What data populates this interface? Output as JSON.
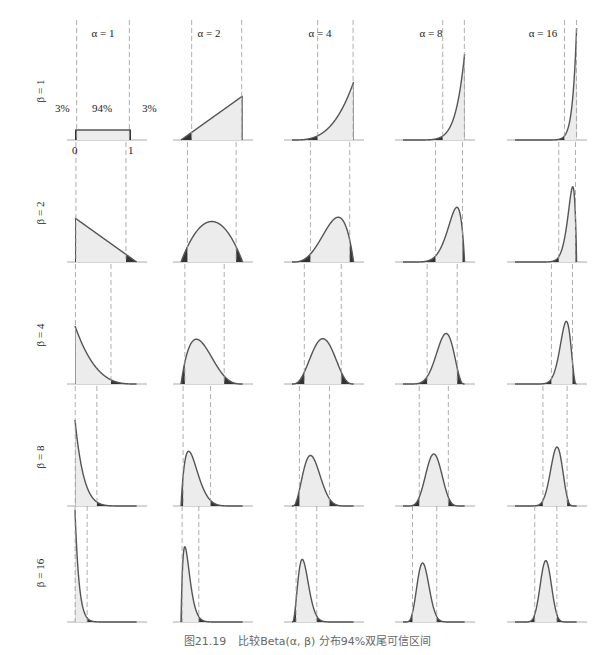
{
  "caption": {
    "number": "图21.19",
    "text": "比较Beta(α, β) 分布94%双尾可信区间"
  },
  "columns": [
    {
      "label": "α = 1",
      "alpha": 1
    },
    {
      "label": "α = 2",
      "alpha": 2
    },
    {
      "label": "α = 4",
      "alpha": 4
    },
    {
      "label": "α = 8",
      "alpha": 8
    },
    {
      "label": "α = 16",
      "alpha": 16
    }
  ],
  "rows": [
    {
      "label": "β = 1",
      "beta": 1
    },
    {
      "label": "β = 2",
      "beta": 2
    },
    {
      "label": "β = 4",
      "beta": 4
    },
    {
      "label": "β = 8",
      "beta": 8
    },
    {
      "label": "β = 16",
      "beta": 16
    }
  ],
  "annotations": {
    "left_tail": "3%",
    "center": "94%",
    "right_tail": "3%",
    "x_min": "0",
    "x_max": "1"
  },
  "colors": {
    "curve": "#555555",
    "fill": "#ececec",
    "tail": "#333333",
    "dashed": "#999999",
    "axis": "#aaaaaa"
  },
  "chart_data": {
    "type": "area",
    "title": "比较Beta(α, β) 分布94%双尾可信区间",
    "xlabel": "",
    "ylabel": "",
    "layout": "5x5 small multiples, columns α ∈ {1,2,4,8,16}, rows β ∈ {1,2,4,8,16}",
    "x_range": [
      0,
      1
    ],
    "credible_interval": 0.94,
    "tail_probability_each": 0.03,
    "series": [
      {
        "alpha": 1,
        "beta": 1,
        "interval": [
          0.03,
          0.97
        ]
      },
      {
        "alpha": 2,
        "beta": 1,
        "interval": [
          0.173,
          0.985
        ]
      },
      {
        "alpha": 4,
        "beta": 1,
        "interval": [
          0.416,
          0.992
        ]
      },
      {
        "alpha": 8,
        "beta": 1,
        "interval": [
          0.645,
          0.996
        ]
      },
      {
        "alpha": 16,
        "beta": 1,
        "interval": [
          0.803,
          0.998
        ]
      },
      {
        "alpha": 1,
        "beta": 2,
        "interval": [
          0.015,
          0.827
        ]
      },
      {
        "alpha": 2,
        "beta": 2,
        "interval": [
          0.105,
          0.895
        ]
      },
      {
        "alpha": 4,
        "beta": 2,
        "interval": [
          0.299,
          0.937
        ]
      },
      {
        "alpha": 8,
        "beta": 2,
        "interval": [
          0.528,
          0.966
        ]
      },
      {
        "alpha": 16,
        "beta": 2,
        "interval": [
          0.71,
          0.982
        ]
      },
      {
        "alpha": 1,
        "beta": 4,
        "interval": [
          0.008,
          0.584
        ]
      },
      {
        "alpha": 2,
        "beta": 4,
        "interval": [
          0.063,
          0.701
        ]
      },
      {
        "alpha": 4,
        "beta": 4,
        "interval": [
          0.2,
          0.8
        ]
      },
      {
        "alpha": 8,
        "beta": 4,
        "interval": [
          0.392,
          0.88
        ]
      },
      {
        "alpha": 16,
        "beta": 4,
        "interval": [
          0.591,
          0.933
        ]
      },
      {
        "alpha": 1,
        "beta": 8,
        "interval": [
          0.004,
          0.355
        ]
      },
      {
        "alpha": 2,
        "beta": 8,
        "interval": [
          0.034,
          0.48
        ]
      },
      {
        "alpha": 4,
        "beta": 8,
        "interval": [
          0.12,
          0.608
        ]
      },
      {
        "alpha": 8,
        "beta": 8,
        "interval": [
          0.264,
          0.736
        ]
      },
      {
        "alpha": 16,
        "beta": 8,
        "interval": [
          0.453,
          0.846
        ]
      },
      {
        "alpha": 1,
        "beta": 16,
        "interval": [
          0.002,
          0.197
        ]
      },
      {
        "alpha": 2,
        "beta": 16,
        "interval": [
          0.018,
          0.289
        ]
      },
      {
        "alpha": 4,
        "beta": 16,
        "interval": [
          0.066,
          0.402
        ]
      },
      {
        "alpha": 8,
        "beta": 16,
        "interval": [
          0.154,
          0.547
        ]
      },
      {
        "alpha": 16,
        "beta": 16,
        "interval": [
          0.32,
          0.68
        ]
      }
    ]
  }
}
